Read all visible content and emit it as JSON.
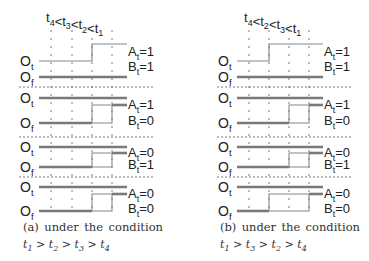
{
  "colors": {
    "thin_line": "#888888",
    "thick_line": "#7a7a7a",
    "dash": "#555555",
    "text": "#222222"
  },
  "panels": [
    {
      "id": "a",
      "ordering_label": "t4<t3<t2<t1",
      "ordering_parts": [
        {
          "t": "t",
          "sub": "4"
        },
        {
          "op": "<"
        },
        {
          "t": "t",
          "sub": "3"
        },
        {
          "op": "<"
        },
        {
          "t": "t",
          "sub": "2"
        },
        {
          "op": "<"
        },
        {
          "t": "t",
          "sub": "1"
        }
      ],
      "x0": 39,
      "x_end": 127,
      "ticks_x": [
        51,
        72,
        92,
        112
      ],
      "tick_order": [
        "t4",
        "t3",
        "t2",
        "t1"
      ],
      "label_x": 128,
      "rows": [
        {
          "ot_label": "Ot",
          "of_label": "Of",
          "a_label": "At=1",
          "b_label": "Bt=1",
          "A": 1,
          "B": 1,
          "step_x": 92
        },
        {
          "ot_label": "Ot",
          "of_label": "Of",
          "a_label": "At=1",
          "b_label": "Bt=0",
          "A": 1,
          "B": 0,
          "box_x1": 92,
          "box_x2": 112
        },
        {
          "ot_label": "Ot",
          "of_label": "Of",
          "a_label": "At=0",
          "b_label": "Bt=1",
          "A": 0,
          "B": 1,
          "box_x1": 92,
          "box_x2": 112
        },
        {
          "ot_label": "Ot",
          "of_label": "Of",
          "a_label": "At=0",
          "b_label": "Bt=0",
          "A": 0,
          "B": 0,
          "box_x1": 92,
          "box_x2": 112
        }
      ],
      "caption_line1": [
        "(a)",
        "under",
        "the",
        "condition"
      ],
      "caption_line2": "t1 > t2 > t3 > t4",
      "caption_x": 23
    },
    {
      "id": "b",
      "ordering_label": "t4<t2<t3<t1",
      "ordering_parts": [
        {
          "t": "t",
          "sub": "4"
        },
        {
          "op": "<"
        },
        {
          "t": "t",
          "sub": "2"
        },
        {
          "op": "<"
        },
        {
          "t": "t",
          "sub": "3"
        },
        {
          "op": "<"
        },
        {
          "t": "t",
          "sub": "1"
        }
      ],
      "x0": 237,
      "x_end": 323,
      "ticks_x": [
        249,
        269,
        289,
        309
      ],
      "tick_order": [
        "t4",
        "t2",
        "t3",
        "t1"
      ],
      "label_x": 324,
      "rows": [
        {
          "ot_label": "Ot",
          "of_label": "Of",
          "a_label": "At=1",
          "b_label": "Bt=1",
          "A": 1,
          "B": 1,
          "step_x": 269
        },
        {
          "ot_label": "Ot",
          "of_label": "Of",
          "a_label": "At=1",
          "b_label": "Bt=0",
          "A": 1,
          "B": 0,
          "box_x1": 289,
          "box_x2": 309
        },
        {
          "ot_label": "Ot",
          "of_label": "Of",
          "a_label": "At=0",
          "b_label": "Bt=1",
          "A": 0,
          "B": 1,
          "box_x1": 289,
          "box_x2": 309
        },
        {
          "ot_label": "Ot",
          "of_label": "Of",
          "a_label": "At=0",
          "b_label": "Bt=0",
          "A": 0,
          "B": 0,
          "box_x1": 269,
          "box_x2": 309
        }
      ],
      "caption_line1": [
        "(b)",
        "under",
        "the",
        "condition"
      ],
      "caption_line2": "t1 > t3 > t2 > t4",
      "caption_x": 220
    }
  ],
  "layout": {
    "title_y": 22,
    "tick_top": 30,
    "tick_bottom": 214,
    "rows_y": [
      {
        "ot": 61,
        "of": 77,
        "high": 44,
        "sep": 87
      },
      {
        "ot": 98,
        "of": 123,
        "high": 105,
        "sep": 137
      },
      {
        "ot": 147,
        "of": 167,
        "high": 153,
        "sep": 177
      },
      {
        "ot": 187,
        "of": 211,
        "high": 194,
        "sep": null
      }
    ],
    "caption_y1": 218,
    "caption_y2": 236
  }
}
